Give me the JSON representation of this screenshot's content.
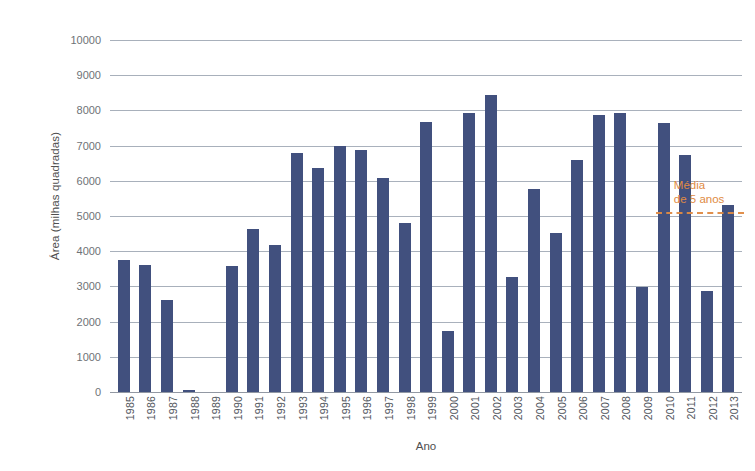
{
  "chart_data": {
    "type": "bar",
    "title": "",
    "xlabel": "Ano",
    "ylabel": "Área (milhas quadradas)",
    "ylim": [
      0,
      10000
    ],
    "ytick_step": 1000,
    "grid": true,
    "grid_axis": "y",
    "legend": false,
    "bar_color": "#41507e",
    "annotation_color": "#e08b44",
    "categories": [
      "1985",
      "1986",
      "1987",
      "1988",
      "1989",
      "1990",
      "1991",
      "1992",
      "1993",
      "1994",
      "1995",
      "1996",
      "1997",
      "1998",
      "1999",
      "2000",
      "2001",
      "2002",
      "2003",
      "2004",
      "2005",
      "2006",
      "2007",
      "2008",
      "2009",
      "2010",
      "2011",
      "2012",
      "2013"
    ],
    "values": [
      3750,
      3620,
      2600,
      60,
      0,
      3580,
      4620,
      4180,
      6790,
      6370,
      7000,
      6880,
      6070,
      4810,
      7680,
      1720,
      7940,
      8430,
      3280,
      5760,
      4520,
      6580,
      7860,
      7930,
      2980,
      7650,
      6730,
      2880,
      5320
    ],
    "ytick_labels": [
      "10000",
      "9000",
      "8000",
      "7000",
      "6000",
      "5000",
      "4000",
      "3000",
      "2000",
      "1000",
      "0"
    ],
    "ytick_values": [
      10000,
      9000,
      8000,
      7000,
      6000,
      5000,
      4000,
      3000,
      2000,
      1000,
      0
    ],
    "annotations": [
      {
        "name": "media-5-anos",
        "label_line1": "Média",
        "label_line2": "de 5 anos",
        "value": 5100,
        "style": "dashed-horizontal-line",
        "x_start_category": "2010",
        "x_end_category": "2013"
      }
    ]
  }
}
